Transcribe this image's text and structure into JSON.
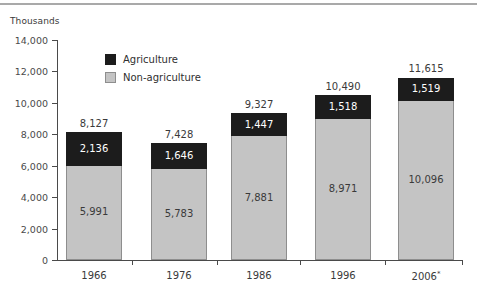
{
  "chart_data": {
    "type": "bar",
    "subtype": "stacked-bar",
    "title": "",
    "unit_caption": "Thousands",
    "xlabel": "",
    "ylabel": "",
    "categories": [
      "1966",
      "1976",
      "1986",
      "1996",
      "2006*"
    ],
    "category_footnote_marker": "*",
    "series": [
      {
        "name": "Non-agriculture",
        "color": "#c4c4c4",
        "values": [
          5991,
          5783,
          7881,
          8971,
          10096
        ],
        "value_labels": [
          "5,991",
          "5,783",
          "7,881",
          "8,971",
          "10,096"
        ]
      },
      {
        "name": "Agriculture",
        "color": "#1c1c1c",
        "values": [
          2136,
          1646,
          1447,
          1518,
          1519
        ],
        "value_labels": [
          "2,136",
          "1,646",
          "1,447",
          "1,518",
          "1,519"
        ]
      }
    ],
    "totals": [
      8127,
      7428,
      9327,
      10490,
      11615
    ],
    "total_labels": [
      "8,127",
      "7,428",
      "9,327",
      "10,490",
      "11,615"
    ],
    "ylim": [
      0,
      14000
    ],
    "ytick_values": [
      0,
      2000,
      4000,
      6000,
      8000,
      10000,
      12000,
      14000
    ],
    "ytick_labels": [
      "0",
      "2,000",
      "4,000",
      "6,000",
      "8,000",
      "10,000",
      "12,000",
      "14,000"
    ],
    "grid": false,
    "legend_position": "inside-top-left",
    "legend": [
      {
        "label": "Agriculture",
        "swatch": "#1c1c1c"
      },
      {
        "label": "Non-agriculture",
        "swatch": "#c4c4c4"
      }
    ]
  },
  "colors": {
    "agriculture": "#1c1c1c",
    "non_agriculture": "#c4c4c4",
    "axis": "#4a4a4a",
    "rule": "#a9a9a9",
    "text": "#3a3a3a"
  }
}
